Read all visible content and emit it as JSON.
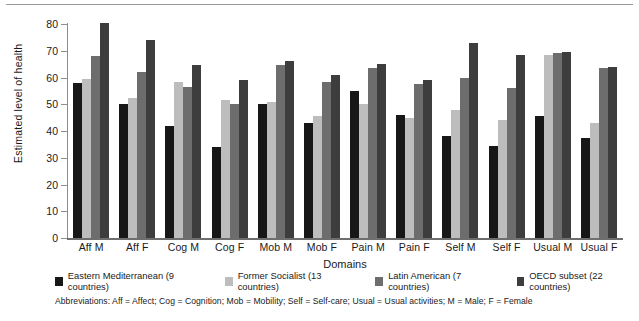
{
  "chart_data": {
    "type": "bar",
    "title": "",
    "xlabel": "Domains",
    "ylabel": "Estimated level of health",
    "ylim": [
      0,
      80
    ],
    "yticks": [
      0,
      10,
      20,
      30,
      40,
      50,
      60,
      70,
      80
    ],
    "grid": false,
    "legend_position": "bottom",
    "categories": [
      "Aff M",
      "Aff F",
      "Cog M",
      "Cog F",
      "Mob M",
      "Mob F",
      "Pain M",
      "Pain F",
      "Self M",
      "Self F",
      "Usual M",
      "Usual F"
    ],
    "series": [
      {
        "name": "Eastern Mediterranean (9 countries)",
        "color": "#171717",
        "values": [
          58,
          50,
          42,
          34,
          50,
          43,
          55,
          46,
          38,
          34.5,
          45.5,
          37.5
        ]
      },
      {
        "name": "Former Socialist (13 countries)",
        "color": "#bdbdbd",
        "values": [
          59.5,
          52.5,
          58.5,
          51.5,
          51,
          45.5,
          50,
          45,
          48,
          44,
          68.5,
          43
        ]
      },
      {
        "name": "Latin American (7 countries)",
        "color": "#6d6d6d",
        "values": [
          68,
          62,
          56.5,
          50,
          64.5,
          58.5,
          63.5,
          57.5,
          60,
          56,
          69,
          63.5
        ]
      },
      {
        "name": "OECD subset (22 countries)",
        "color": "#3d3d3d",
        "values": [
          80.5,
          74,
          64.5,
          59,
          66,
          61,
          65,
          59,
          73,
          68.5,
          69.5,
          64
        ]
      }
    ],
    "annotations": [
      "Abbreviations: Aff = Affect; Cog = Cognition; Mob = Mobility; Self = Self-care; Usual = Usual activities; M = Male; F = Female"
    ]
  },
  "axis": {
    "y_title": "Estimated level of health",
    "x_title": "Domains",
    "y_ticks": [
      "80",
      "70",
      "60",
      "50",
      "40",
      "30",
      "20",
      "10",
      "0"
    ]
  },
  "legend": {
    "items": [
      {
        "label": "Eastern Mediterranean (9 countries)",
        "color": "#171717"
      },
      {
        "label": "Former Socialist (13 countries)",
        "color": "#bdbdbd"
      },
      {
        "label": "Latin American (7 countries)",
        "color": "#6d6d6d"
      },
      {
        "label": "OECD subset (22 countries)",
        "color": "#3d3d3d"
      }
    ]
  },
  "footnote": "Abbreviations:  Aff = Affect; Cog = Cognition; Mob = Mobility; Self = Self-care; Usual = Usual activities; M = Male; F = Female"
}
